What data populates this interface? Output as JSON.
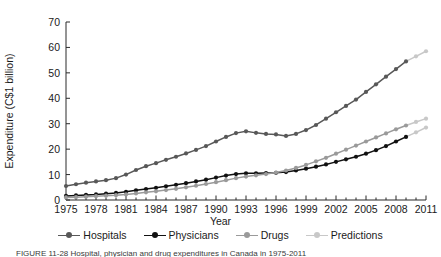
{
  "figure": {
    "caption": "FIGURE 11-28   Hospital, physician and drug expenditures in Canada in 1975-2011"
  },
  "axes": {
    "y_title": "Expenditure (C$1 billion)",
    "x_title": "Year",
    "y_ticks": [
      0,
      10,
      20,
      30,
      40,
      50,
      60,
      70
    ],
    "x_ticks": [
      1975,
      1978,
      1981,
      1984,
      1987,
      1990,
      1993,
      1996,
      1999,
      2002,
      2005,
      2008,
      2011
    ]
  },
  "legend": {
    "items": [
      {
        "label": "Hospitals",
        "color": "#585858"
      },
      {
        "label": "Physicians",
        "color": "#111111"
      },
      {
        "label": "Drugs",
        "color": "#9a9a9a"
      },
      {
        "label": "Predictions",
        "color": "#c8c8c8"
      }
    ]
  },
  "colors": {
    "hospitals": "#585858",
    "physicians": "#111111",
    "drugs": "#9a9a9a",
    "predictions": "#c8c8c8",
    "axis": "#2b2b2b"
  },
  "chart_data": {
    "type": "line",
    "title": "",
    "xlabel": "Year",
    "ylabel": "Expenditure (C$1 billion)",
    "xlim": [
      1975,
      2011
    ],
    "ylim": [
      0,
      70
    ],
    "grid": false,
    "legend_position": "bottom",
    "x": [
      1975,
      1976,
      1977,
      1978,
      1979,
      1980,
      1981,
      1982,
      1983,
      1984,
      1985,
      1986,
      1987,
      1988,
      1989,
      1990,
      1991,
      1992,
      1993,
      1994,
      1995,
      1996,
      1997,
      1998,
      1999,
      2000,
      2001,
      2002,
      2003,
      2004,
      2005,
      2006,
      2007,
      2008,
      2009,
      2010,
      2011
    ],
    "series": [
      {
        "name": "Hospitals",
        "color": "#585858",
        "values": [
          5.5,
          6.2,
          6.8,
          7.3,
          7.8,
          8.6,
          10.0,
          11.8,
          13.3,
          14.5,
          15.8,
          17.0,
          18.3,
          19.7,
          21.2,
          23.0,
          24.8,
          26.3,
          27.0,
          26.4,
          26.0,
          25.8,
          25.2,
          26.0,
          27.5,
          29.5,
          32.0,
          34.5,
          37.0,
          39.5,
          42.5,
          45.5,
          48.5,
          51.5,
          54.5,
          56.5,
          58.5
        ],
        "predicted_from": 2009
      },
      {
        "name": "Physicians",
        "color": "#111111",
        "values": [
          1.6,
          1.8,
          2.0,
          2.2,
          2.5,
          2.8,
          3.2,
          3.8,
          4.3,
          4.8,
          5.4,
          6.0,
          6.6,
          7.3,
          8.0,
          8.8,
          9.6,
          10.2,
          10.5,
          10.5,
          10.6,
          10.7,
          11.0,
          11.6,
          12.3,
          13.1,
          14.0,
          15.0,
          16.0,
          17.0,
          18.2,
          19.6,
          21.2,
          23.0,
          24.8,
          26.6,
          28.5
        ],
        "predicted_from": 2009
      },
      {
        "name": "Drugs",
        "color": "#9a9a9a",
        "values": [
          1.0,
          1.1,
          1.3,
          1.5,
          1.7,
          1.9,
          2.2,
          2.6,
          3.0,
          3.4,
          3.9,
          4.4,
          5.0,
          5.6,
          6.3,
          7.0,
          7.8,
          8.6,
          9.2,
          9.7,
          10.2,
          10.8,
          11.6,
          12.6,
          13.8,
          15.2,
          16.6,
          18.2,
          19.8,
          21.4,
          23.0,
          24.6,
          26.2,
          27.8,
          29.3,
          30.7,
          32.0
        ],
        "predicted_from": 2009
      }
    ]
  }
}
